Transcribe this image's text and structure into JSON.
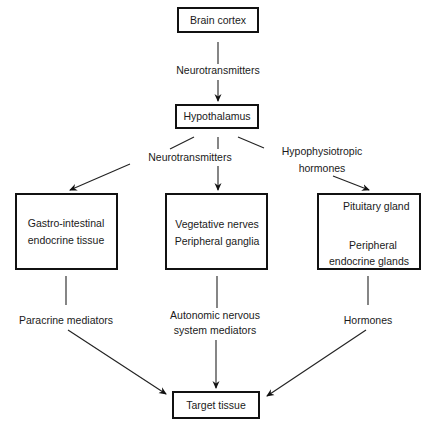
{
  "diagram": {
    "nodes": {
      "brain_cortex": {
        "lines": [
          "Brain cortex"
        ]
      },
      "hypothalamus": {
        "lines": [
          "Hypothalamus"
        ]
      },
      "gi_tissue": {
        "lines": [
          "Gastro-intestinal",
          "endocrine tissue"
        ]
      },
      "vegetative": {
        "lines": [
          "Vegetative nerves",
          "Peripheral ganglia"
        ]
      },
      "pituitary": {
        "lines": [
          "Pituitary gland",
          "Peripheral",
          "endocrine glands"
        ]
      },
      "target": {
        "lines": [
          "Target tissue"
        ]
      }
    },
    "edge_labels": {
      "cortex_to_hypothalamus": [
        "Neurotransmitters"
      ],
      "hypothalamus_neuro": [
        "Neurotransmitters"
      ],
      "hypothalamus_hypophysio": [
        "Hypophysiotropic",
        "hormones"
      ],
      "gi_to_target": [
        "Paracrine mediators"
      ],
      "vegetative_to_target": [
        "Autonomic nervous",
        "system  mediators"
      ],
      "pituitary_to_target": [
        "Hormones"
      ]
    }
  }
}
